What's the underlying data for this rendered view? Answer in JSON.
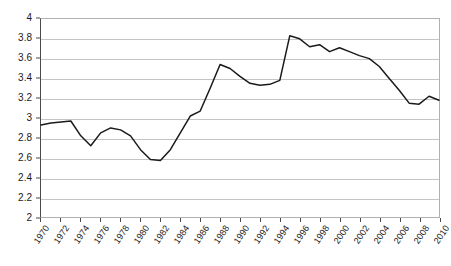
{
  "chart_data": {
    "type": "line",
    "title": "",
    "subtitle": "",
    "xlabel": "",
    "ylabel": "",
    "xlim": [
      1970,
      2010
    ],
    "ylim": [
      2,
      4
    ],
    "ytick_step": 0.2,
    "xtick_step": 2,
    "grid": true,
    "legend": false,
    "legend_position": "none",
    "line_color": "#1a1a1a",
    "grid_color": "#c4c4c4",
    "axis_color": "#4a4a4a",
    "background_color": "#ffffff",
    "y_ticks": [
      "2",
      "2.2",
      "2.4",
      "2.6",
      "2.8",
      "3",
      "3.2",
      "3.4",
      "3.6",
      "3.8",
      "4"
    ],
    "x_ticks": [
      "1970",
      "1972",
      "1974",
      "1976",
      "1978",
      "1980",
      "1982",
      "1984",
      "1986",
      "1988",
      "1990",
      "1992",
      "1994",
      "1996",
      "1998",
      "2000",
      "2002",
      "2004",
      "2006",
      "2008",
      "2010"
    ],
    "x": [
      1970,
      1971,
      1972,
      1973,
      1974,
      1975,
      1976,
      1977,
      1978,
      1979,
      1980,
      1981,
      1982,
      1983,
      1984,
      1985,
      1986,
      1987,
      1988,
      1989,
      1990,
      1991,
      1992,
      1993,
      1994,
      1995,
      1996,
      1997,
      1998,
      1999,
      2000,
      2001,
      2002,
      2003,
      2004,
      2005,
      2006,
      2007,
      2008,
      2009,
      2010
    ],
    "values": [
      2.93,
      2.95,
      2.96,
      2.97,
      2.82,
      2.72,
      2.85,
      2.9,
      2.88,
      2.82,
      2.68,
      2.58,
      2.57,
      2.68,
      2.85,
      3.02,
      3.07,
      3.3,
      3.54,
      3.5,
      3.42,
      3.35,
      3.33,
      3.34,
      3.38,
      3.83,
      3.8,
      3.72,
      3.74,
      3.67,
      3.71,
      3.67,
      3.63,
      3.6,
      3.52,
      3.4,
      3.28,
      3.15,
      3.14,
      3.22,
      3.18
    ]
  }
}
